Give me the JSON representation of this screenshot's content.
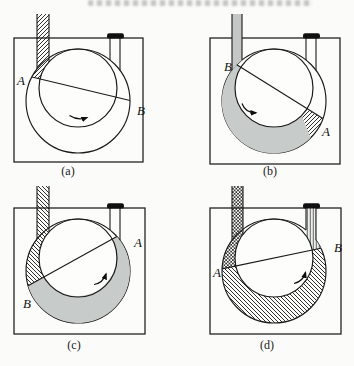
{
  "figure": {
    "kind": "rotary-vane pump cycle diagram",
    "colors": {
      "line": "#1b1b1b",
      "gas_gray_fill": "#c7cbca",
      "inlet_tube_gray": "#c3c7c6",
      "outlet_valve_cap": "#101010",
      "page_background": "#fbfbf9"
    },
    "panels": [
      {
        "caption": "(a)",
        "left_label": "A",
        "right_label": "B",
        "rotation": "counterclockwise"
      },
      {
        "caption": "(b)",
        "left_label": "B",
        "right_label": "A",
        "rotation": "counterclockwise"
      },
      {
        "caption": "(c)",
        "left_label": "B",
        "right_label": "A",
        "rotation": "counterclockwise"
      },
      {
        "caption": "(d)",
        "left_label": "A",
        "right_label": "B",
        "rotation": "counterclockwise"
      }
    ]
  }
}
